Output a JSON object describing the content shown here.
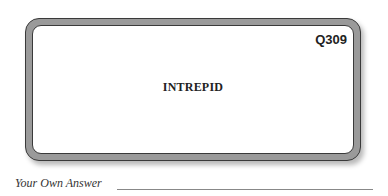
{
  "card": {
    "question_id": "Q309",
    "word": "INTREPID"
  },
  "answer": {
    "label": "Your Own Answer",
    "value": ""
  }
}
